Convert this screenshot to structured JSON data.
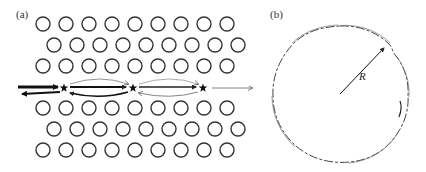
{
  "figure": {
    "panel_a": {
      "label": "(a)",
      "lattice": {
        "rows_top": [
          {
            "y": 24,
            "x_start": 43,
            "count": 9
          },
          {
            "y": 45,
            "x_start": 54,
            "count": 9
          },
          {
            "y": 66,
            "x_start": 43,
            "count": 9
          }
        ],
        "rows_bottom": [
          {
            "y": 108,
            "x_start": 43,
            "count": 9
          },
          {
            "y": 129,
            "x_start": 54,
            "count": 9
          },
          {
            "y": 150,
            "x_start": 43,
            "count": 9
          }
        ],
        "spacing": 23,
        "radius": 7,
        "stroke_color": "#333333"
      },
      "stars": [
        {
          "x": 64,
          "y": 88
        },
        {
          "x": 133,
          "y": 88
        },
        {
          "x": 203,
          "y": 88
        }
      ],
      "arrow_color": "#111111",
      "thin_arrow_color": "#666666"
    },
    "panel_b": {
      "label": "(b)",
      "circle": {
        "cx": 340,
        "cy": 94,
        "r": 68
      },
      "radius_label": "R",
      "arrow": {
        "x1": 340,
        "y1": 94,
        "x2": 385,
        "y2": 47
      }
    }
  }
}
